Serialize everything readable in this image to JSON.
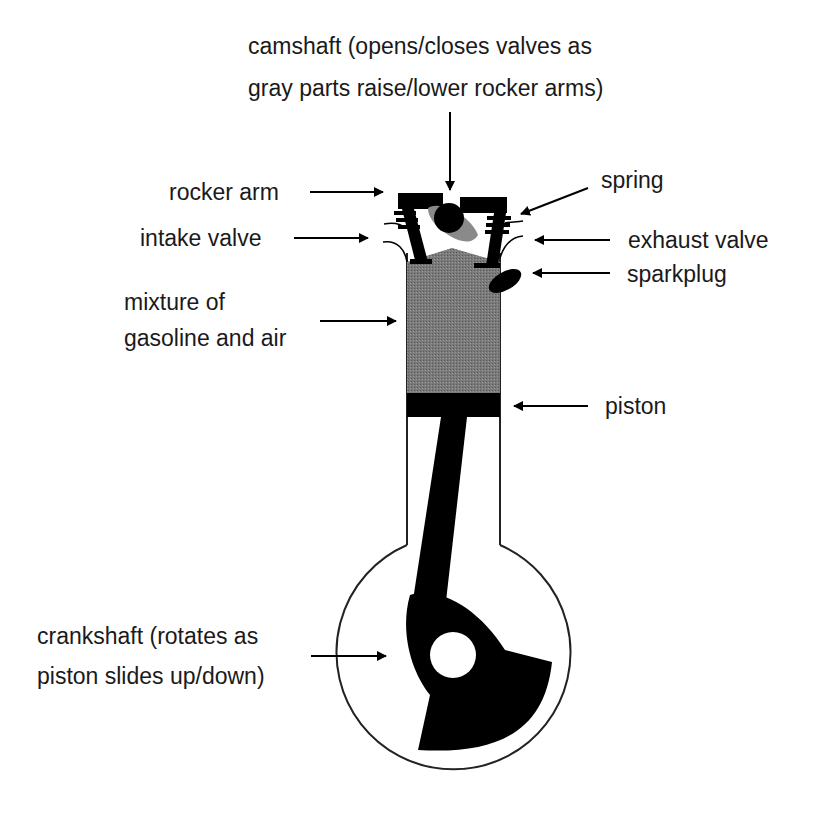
{
  "diagram": {
    "colors": {
      "ink": "#000000",
      "mixture_gray": "#707070",
      "cam_gray": "#8a8a8a",
      "background": "#ffffff"
    },
    "labels": {
      "camshaft_line1": "camshaft (opens/closes valves as",
      "camshaft_line2": "gray parts raise/lower rocker arms)",
      "rocker_arm": "rocker arm",
      "intake_valve": "intake valve",
      "spring": "spring",
      "exhaust_valve": "exhaust valve",
      "sparkplug": "sparkplug",
      "mixture_line1": "mixture of",
      "mixture_line2": "gasoline and air",
      "piston": "piston",
      "crankshaft_line1": "crankshaft  (rotates as",
      "crankshaft_line2": "piston slides up/down)"
    }
  }
}
